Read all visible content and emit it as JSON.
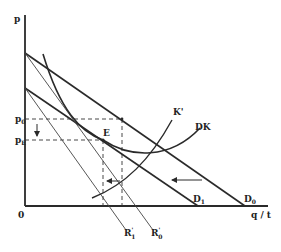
{
  "diagram": {
    "axes": {
      "y_label": "p",
      "x_label": "q / t",
      "origin_label": "0"
    },
    "price_labels": {
      "p0": {
        "base": "p",
        "sub": "0"
      },
      "pE": {
        "base": "p",
        "sub": "E"
      }
    },
    "curves": {
      "D0": {
        "base": "D",
        "sub": "0"
      },
      "D1": {
        "base": "D",
        "sub": "1"
      },
      "DK": "DK",
      "K_prime": "K'",
      "R0_prime": {
        "base": "R",
        "sup": "'",
        "sub": "0"
      },
      "R1_prime": {
        "base": "R",
        "sup": "'",
        "sub": "1"
      }
    },
    "points": {
      "E": "E"
    },
    "colors": {
      "line": "#2a2a2a",
      "thin_line": "#444444",
      "background": "#ffffff"
    }
  }
}
